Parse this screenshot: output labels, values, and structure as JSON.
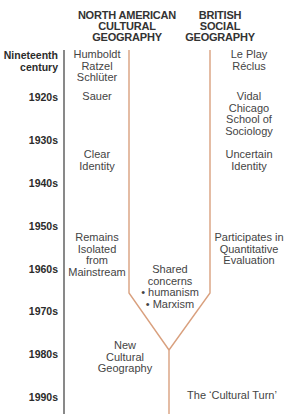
{
  "headers": {
    "left": [
      "NORTH AMERICAN",
      "CULTURAL",
      "GEOGRAPHY"
    ],
    "right": [
      "BRITISH",
      "SOCIAL",
      "GEOGRAPHY"
    ]
  },
  "decades": [
    "Nineteenth century",
    "1920s",
    "1930s",
    "1940s",
    "1950s",
    "1960s",
    "1970s",
    "1980s",
    "1990s"
  ],
  "north_american": {
    "nineteenth": [
      "Humboldt",
      "Ratzel",
      "Schlüter"
    ],
    "1920s": "Sauer",
    "1930s_40s": [
      "Clear",
      "Identity"
    ],
    "1950s_60s": [
      "Remains",
      "Isolated",
      "from",
      "Mainstream"
    ],
    "1980s": [
      "New",
      "Cultural",
      "Geography"
    ]
  },
  "british": {
    "nineteenth": [
      "Le Play",
      "Réclus"
    ],
    "1920s": [
      "Vidal",
      "Chicago",
      "School of",
      "Sociology"
    ],
    "1930s_40s": [
      "Uncertain",
      "Identity"
    ],
    "1950s_60s": [
      "Participates in",
      "Quantitative",
      "Evaluation"
    ]
  },
  "shared": [
    "Shared",
    "concerns",
    "• humanism",
    "• Marxism"
  ],
  "convergence": "The ‘Cultural Turn’",
  "colors": {
    "timeline": "#4a4a4a",
    "branches": "#d9a07e"
  }
}
